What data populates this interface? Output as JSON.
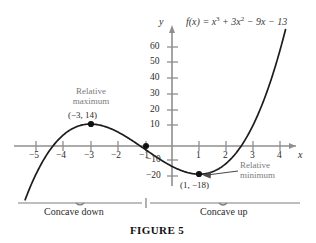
{
  "figure": {
    "caption": "FIGURE 5",
    "equation_plain": "f(x) = x^3 + 3x^2 - 9x - 13",
    "equation_parts": {
      "fx": "f(x) = x",
      "exp1": "3",
      "mid": " + 3x",
      "exp2": "2",
      "tail": " − 9x − 13"
    }
  },
  "axes": {
    "x_label": "x",
    "y_label": "y",
    "x_ticks": [
      "−5",
      "−4",
      "−3",
      "−2",
      "−1",
      "1",
      "2",
      "3",
      "4"
    ],
    "y_ticks": [
      "60",
      "50",
      "40",
      "30",
      "20",
      "10",
      "−10",
      "−20"
    ]
  },
  "annotations": {
    "max_line1": "Relative",
    "max_line2": "maximum",
    "max_point": "(−3, 14)",
    "min_line1": "Relative",
    "min_line2": "minimum",
    "min_point": "(1, −18)"
  },
  "concavity": {
    "down": "Concave down",
    "up": "Concave up"
  },
  "colors": {
    "curve": "#1c1c1c",
    "axis": "#8a8a8a",
    "annotation_text": "#7b7b7b",
    "point": "#111111",
    "background": "#ffffff"
  },
  "chart_data": {
    "type": "line",
    "title": "",
    "subtitle": "",
    "xlabel": "x",
    "ylabel": "y",
    "xlim": [
      -5.4,
      4.4
    ],
    "ylim": [
      -27,
      72
    ],
    "grid": false,
    "legend": null,
    "function": "f(x) = x^3 + 3x^2 - 9x - 13",
    "x_ticks": [
      -5,
      -4,
      -3,
      -2,
      -1,
      1,
      2,
      3,
      4
    ],
    "y_ticks": [
      -20,
      -10,
      10,
      20,
      30,
      40,
      50,
      60
    ],
    "series": [
      {
        "name": "f(x) = x^3 + 3x^2 - 9x - 13",
        "x": [
          -5.35,
          -5.2,
          -5.0,
          -4.8,
          -4.6,
          -4.4,
          -4.2,
          -4.0,
          -3.8,
          -3.6,
          -3.4,
          -3.2,
          -3.0,
          -2.8,
          -2.6,
          -2.4,
          -2.2,
          -2.0,
          -1.8,
          -1.6,
          -1.4,
          -1.2,
          -1.0,
          -0.8,
          -0.6,
          -0.4,
          -0.2,
          0.0,
          0.2,
          0.4,
          0.6,
          0.8,
          1.0,
          1.2,
          1.4,
          1.6,
          1.8,
          2.0,
          2.2,
          2.4,
          2.6,
          2.8,
          3.0,
          3.2,
          3.4,
          3.6,
          3.8,
          4.0,
          4.15
        ],
        "y": [
          -32.1,
          -26.0,
          -18.0,
          -11.2,
          -5.4,
          -0.7,
          3.1,
          6.0,
          8.1,
          9.4,
          10.1,
          10.2,
          10.0,
          9.4,
          8.6,
          7.6,
          6.5,
          5.0,
          4.1,
          3.0,
          2.0,
          1.1,
          0.0,
          -1.2,
          -2.4,
          -3.6,
          -4.8,
          -13.0,
          -14.7,
          -16.1,
          -17.1,
          -17.8,
          -18.0,
          -17.8,
          -17.0,
          -15.6,
          -13.6,
          -11.0,
          -7.7,
          -3.7,
          1.1,
          -0.0,
          5.0,
          11.4,
          18.1,
          25.0,
          32.2,
          39.0,
          47.0
        ],
        "note": "cubic y = x^3 + 3x^2 - 9x - 13; plotted from x≈-5.35 to x≈4.15"
      }
    ],
    "points": [
      {
        "label": "Relative maximum",
        "x": -3,
        "y": 14,
        "display": "(−3, 14)"
      },
      {
        "label": "Relative minimum",
        "x": 1,
        "y": -18,
        "display": "(1, −18)"
      },
      {
        "label": "Inflection point",
        "x": -1,
        "y": 0,
        "display": ""
      }
    ],
    "regions": [
      {
        "label": "Concave down",
        "x_range": [
          -5.4,
          -1
        ]
      },
      {
        "label": "Concave up",
        "x_range": [
          -1,
          4.4
        ]
      }
    ]
  }
}
